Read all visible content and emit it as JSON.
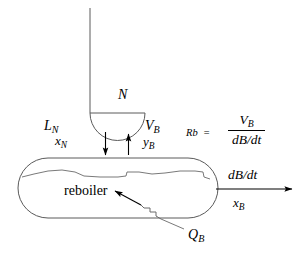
{
  "diagram": {
    "vessel_label": "reboiler",
    "stroke_color": "#4a4a4a",
    "text_color": "#000000",
    "background": "#ffffff"
  },
  "labels": {
    "stage_n": "N",
    "liquid_flow": "L",
    "liquid_flow_sub": "N",
    "liquid_comp": "x",
    "liquid_comp_sub": "N",
    "vapor_flow": "V",
    "vapor_flow_sub": "B",
    "vapor_comp": "y",
    "vapor_comp_sub": "B",
    "heat_duty": "Q",
    "heat_duty_sub": "B",
    "bottoms_rate": "dB/dt",
    "bottoms_comp": "x",
    "bottoms_comp_sub": "B"
  },
  "equation": {
    "lhs": "Rb",
    "equals": "=",
    "numerator": "V",
    "numerator_sub": "B",
    "denominator": "dB/dt"
  }
}
